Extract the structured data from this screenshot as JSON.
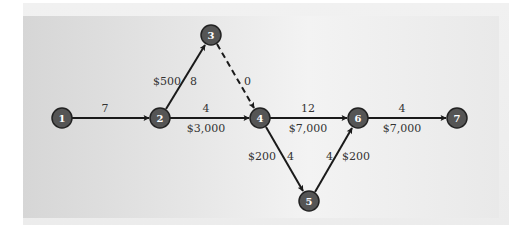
{
  "diagram": {
    "type": "network",
    "colors": {
      "node_fill": "#555555",
      "node_stroke": "#222222",
      "node_text": "#ffffff",
      "edge": "#1a1a1a",
      "label_text": "#333333"
    },
    "nodes": [
      {
        "id": "1",
        "label": "1",
        "x": 62,
        "y": 118
      },
      {
        "id": "2",
        "label": "2",
        "x": 160,
        "y": 118
      },
      {
        "id": "3",
        "label": "3",
        "x": 211,
        "y": 35
      },
      {
        "id": "4",
        "label": "4",
        "x": 260,
        "y": 118
      },
      {
        "id": "5",
        "label": "5",
        "x": 309,
        "y": 201
      },
      {
        "id": "6",
        "label": "6",
        "x": 358,
        "y": 118
      },
      {
        "id": "7",
        "label": "7",
        "x": 457,
        "y": 118
      }
    ],
    "edges": [
      {
        "from": "1",
        "to": "2",
        "time": "7",
        "cost": "",
        "style": "solid"
      },
      {
        "from": "2",
        "to": "3",
        "time": "8",
        "cost": "$500",
        "style": "solid"
      },
      {
        "from": "3",
        "to": "4",
        "time": "0",
        "cost": "",
        "style": "dashed"
      },
      {
        "from": "2",
        "to": "4",
        "time": "4",
        "cost": "$3,000",
        "style": "solid"
      },
      {
        "from": "4",
        "to": "6",
        "time": "12",
        "cost": "$7,000",
        "style": "solid"
      },
      {
        "from": "4",
        "to": "5",
        "time": "4",
        "cost": "$200",
        "style": "solid"
      },
      {
        "from": "5",
        "to": "6",
        "time": "4",
        "cost": "$200",
        "style": "solid"
      },
      {
        "from": "6",
        "to": "7",
        "time": "4",
        "cost": "$7,000",
        "style": "solid"
      }
    ]
  }
}
